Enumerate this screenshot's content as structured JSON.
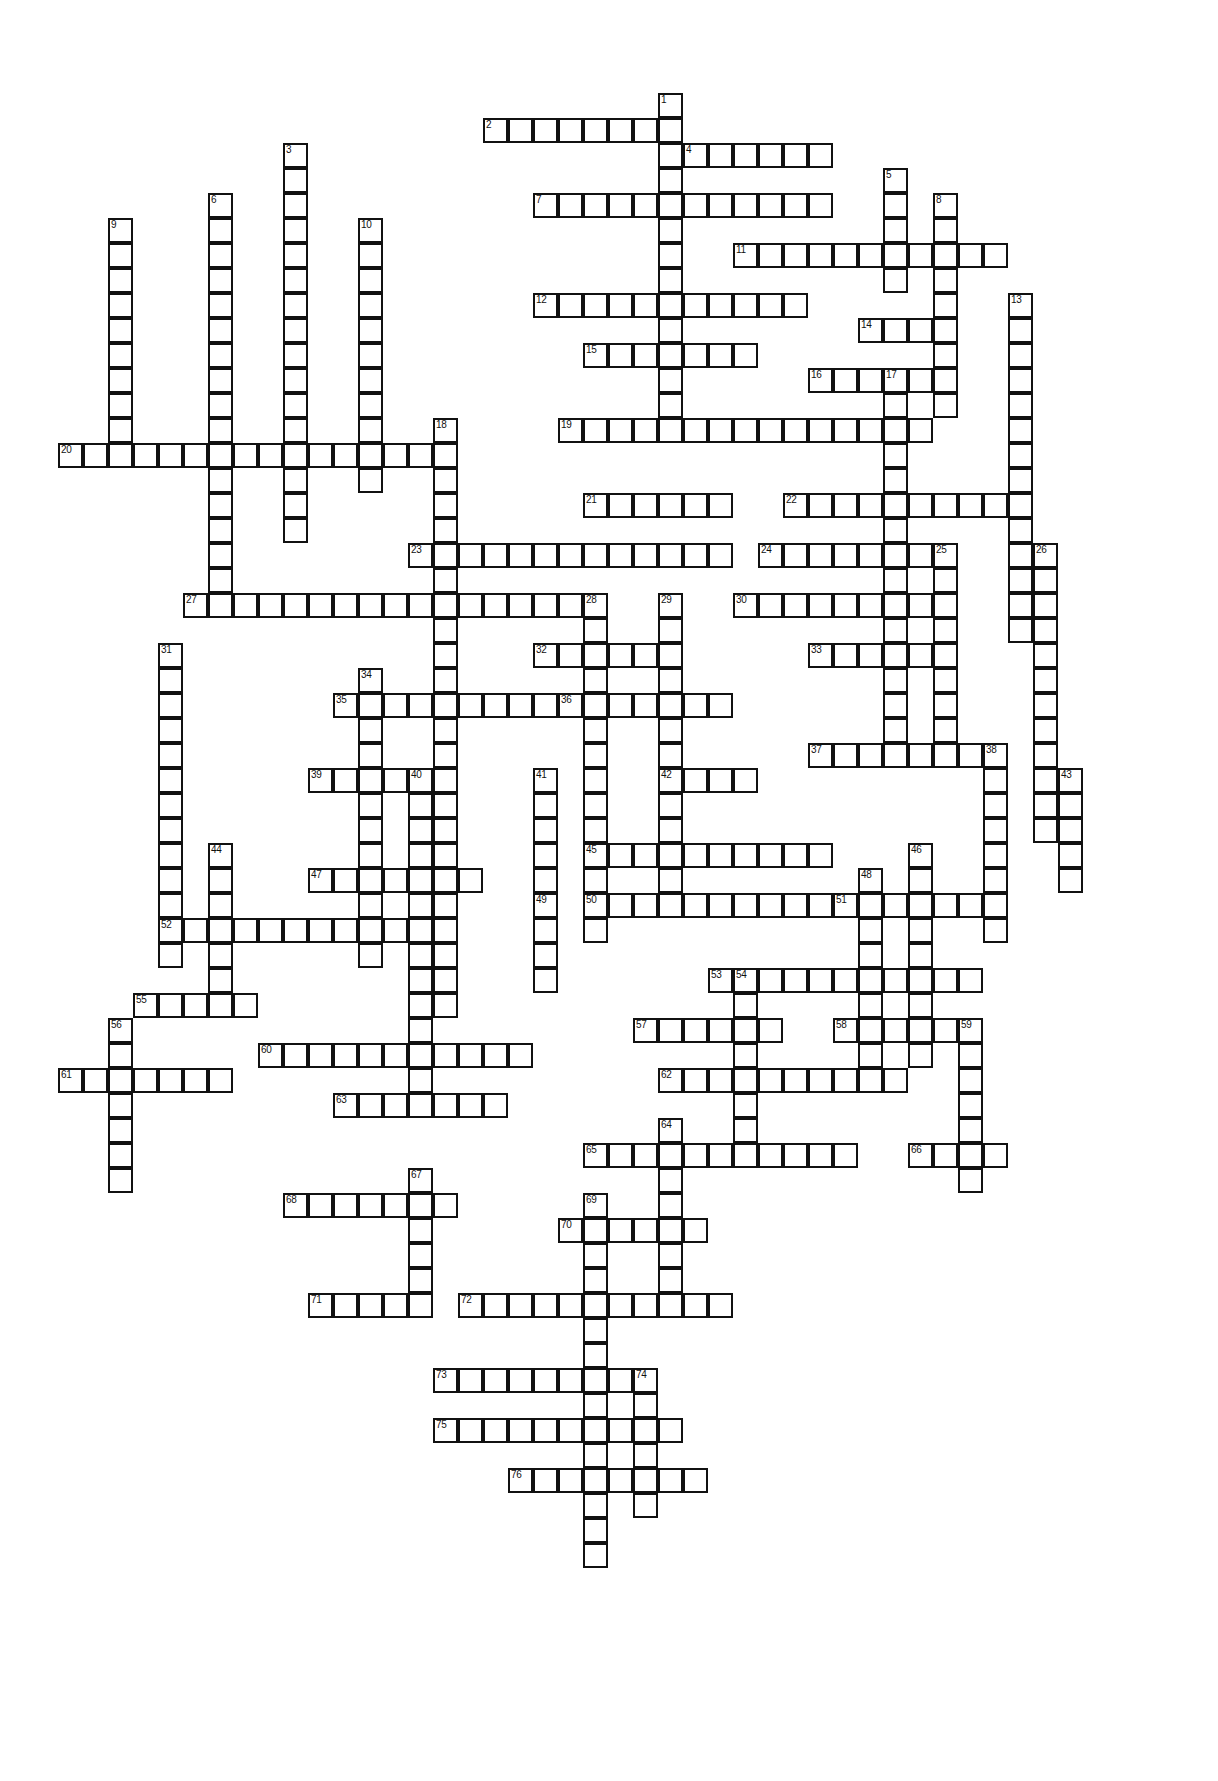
{
  "puzzle": {
    "type": "crossword-grid",
    "title": "",
    "cell_size": 25,
    "origin_x": 58,
    "origin_y": 93,
    "colors": {
      "cell_fill": "#ffffff",
      "cell_border": "#111111",
      "number_text": "#111111",
      "background": "#ffffff"
    },
    "clue_count": 76,
    "entries": [
      {
        "number": "1",
        "direction": "down",
        "col": 24,
        "row": 0,
        "length": 14
      },
      {
        "number": "2",
        "direction": "across",
        "col": 17,
        "row": 1,
        "length": 8
      },
      {
        "number": "3",
        "direction": "down",
        "col": 9,
        "row": 2,
        "length": 16
      },
      {
        "number": "4",
        "direction": "across",
        "col": 25,
        "row": 2,
        "length": 6
      },
      {
        "number": "5",
        "direction": "down",
        "col": 33,
        "row": 3,
        "length": 5
      },
      {
        "number": "6",
        "direction": "down",
        "col": 6,
        "row": 4,
        "length": 16
      },
      {
        "number": "7",
        "direction": "across",
        "col": 19,
        "row": 4,
        "length": 12
      },
      {
        "number": "8",
        "direction": "down",
        "col": 35,
        "row": 4,
        "length": 9
      },
      {
        "number": "9",
        "direction": "down",
        "col": 2,
        "row": 5,
        "length": 10
      },
      {
        "number": "10",
        "direction": "down",
        "col": 12,
        "row": 5,
        "length": 11
      },
      {
        "number": "11",
        "direction": "across",
        "col": 27,
        "row": 6,
        "length": 11
      },
      {
        "number": "12",
        "direction": "across",
        "col": 19,
        "row": 8,
        "length": 11
      },
      {
        "number": "13",
        "direction": "down",
        "col": 38,
        "row": 8,
        "length": 14
      },
      {
        "number": "14",
        "direction": "across",
        "col": 32,
        "row": 9,
        "length": 4
      },
      {
        "number": "15",
        "direction": "across",
        "col": 21,
        "row": 10,
        "length": 7
      },
      {
        "number": "16",
        "direction": "across",
        "col": 30,
        "row": 11,
        "length": 5
      },
      {
        "number": "17",
        "direction": "down",
        "col": 33,
        "row": 11,
        "length": 15
      },
      {
        "number": "18",
        "direction": "down",
        "col": 15,
        "row": 13,
        "length": 24
      },
      {
        "number": "19",
        "direction": "across",
        "col": 20,
        "row": 13,
        "length": 15
      },
      {
        "number": "20",
        "direction": "across",
        "col": 0,
        "row": 14,
        "length": 16
      },
      {
        "number": "21",
        "direction": "across",
        "col": 21,
        "row": 16,
        "length": 6
      },
      {
        "number": "22",
        "direction": "across",
        "col": 29,
        "row": 16,
        "length": 9
      },
      {
        "number": "23",
        "direction": "across",
        "col": 14,
        "row": 18,
        "length": 13
      },
      {
        "number": "24",
        "direction": "across",
        "col": 28,
        "row": 18,
        "length": 7
      },
      {
        "number": "25",
        "direction": "down",
        "col": 35,
        "row": 18,
        "length": 9
      },
      {
        "number": "26",
        "direction": "down",
        "col": 39,
        "row": 18,
        "length": 12
      },
      {
        "number": "27",
        "direction": "across",
        "col": 5,
        "row": 20,
        "length": 16
      },
      {
        "number": "28",
        "direction": "down",
        "col": 21,
        "row": 20,
        "length": 14
      },
      {
        "number": "29",
        "direction": "down",
        "col": 24,
        "row": 20,
        "length": 12
      },
      {
        "number": "30",
        "direction": "across",
        "col": 27,
        "row": 20,
        "length": 8
      },
      {
        "number": "31",
        "direction": "down",
        "col": 4,
        "row": 22,
        "length": 13
      },
      {
        "number": "32",
        "direction": "across",
        "col": 19,
        "row": 22,
        "length": 6
      },
      {
        "number": "33",
        "direction": "across",
        "col": 30,
        "row": 22,
        "length": 5
      },
      {
        "number": "34",
        "direction": "down",
        "col": 12,
        "row": 23,
        "length": 12
      },
      {
        "number": "35",
        "direction": "across",
        "col": 11,
        "row": 24,
        "length": 9
      },
      {
        "number": "36",
        "direction": "across",
        "col": 20,
        "row": 24,
        "length": 7
      },
      {
        "number": "37",
        "direction": "across",
        "col": 30,
        "row": 26,
        "length": 8
      },
      {
        "number": "38",
        "direction": "down",
        "col": 37,
        "row": 26,
        "length": 8
      },
      {
        "number": "39",
        "direction": "across",
        "col": 10,
        "row": 27,
        "length": 5
      },
      {
        "number": "40",
        "direction": "down",
        "col": 14,
        "row": 27,
        "length": 14
      },
      {
        "number": "41",
        "direction": "down",
        "col": 19,
        "row": 27,
        "length": 9
      },
      {
        "number": "42",
        "direction": "across",
        "col": 24,
        "row": 27,
        "length": 4
      },
      {
        "number": "43",
        "direction": "down",
        "col": 40,
        "row": 27,
        "length": 5
      },
      {
        "number": "44",
        "direction": "down",
        "col": 6,
        "row": 30,
        "length": 7
      },
      {
        "number": "45",
        "direction": "across",
        "col": 21,
        "row": 30,
        "length": 10
      },
      {
        "number": "46",
        "direction": "down",
        "col": 34,
        "row": 30,
        "length": 9
      },
      {
        "number": "47",
        "direction": "across",
        "col": 10,
        "row": 31,
        "length": 7
      },
      {
        "number": "48",
        "direction": "down",
        "col": 32,
        "row": 31,
        "length": 9
      },
      {
        "number": "49",
        "direction": "down",
        "col": 19,
        "row": 32,
        "length": 4
      },
      {
        "number": "50",
        "direction": "across",
        "col": 21,
        "row": 32,
        "length": 10
      },
      {
        "number": "51",
        "direction": "across",
        "col": 31,
        "row": 32,
        "length": 7
      },
      {
        "number": "52",
        "direction": "across",
        "col": 4,
        "row": 33,
        "length": 10
      },
      {
        "number": "53",
        "direction": "across",
        "col": 26,
        "row": 35,
        "length": 11
      },
      {
        "number": "54",
        "direction": "down",
        "col": 27,
        "row": 35,
        "length": 8
      },
      {
        "number": "55",
        "direction": "across",
        "col": 3,
        "row": 36,
        "length": 5
      },
      {
        "number": "56",
        "direction": "down",
        "col": 2,
        "row": 37,
        "length": 7
      },
      {
        "number": "57",
        "direction": "across",
        "col": 23,
        "row": 37,
        "length": 6
      },
      {
        "number": "58",
        "direction": "across",
        "col": 31,
        "row": 37,
        "length": 6
      },
      {
        "number": "59",
        "direction": "down",
        "col": 36,
        "row": 37,
        "length": 7
      },
      {
        "number": "60",
        "direction": "across",
        "col": 8,
        "row": 38,
        "length": 11
      },
      {
        "number": "61",
        "direction": "across",
        "col": 0,
        "row": 39,
        "length": 7
      },
      {
        "number": "62",
        "direction": "across",
        "col": 24,
        "row": 39,
        "length": 10
      },
      {
        "number": "63",
        "direction": "across",
        "col": 11,
        "row": 40,
        "length": 7
      },
      {
        "number": "64",
        "direction": "down",
        "col": 24,
        "row": 41,
        "length": 7
      },
      {
        "number": "65",
        "direction": "across",
        "col": 21,
        "row": 42,
        "length": 11
      },
      {
        "number": "66",
        "direction": "across",
        "col": 34,
        "row": 42,
        "length": 4
      },
      {
        "number": "67",
        "direction": "down",
        "col": 14,
        "row": 43,
        "length": 6
      },
      {
        "number": "68",
        "direction": "across",
        "col": 9,
        "row": 44,
        "length": 7
      },
      {
        "number": "69",
        "direction": "down",
        "col": 21,
        "row": 44,
        "length": 15
      },
      {
        "number": "70",
        "direction": "across",
        "col": 20,
        "row": 45,
        "length": 6
      },
      {
        "number": "71",
        "direction": "across",
        "col": 10,
        "row": 48,
        "length": 5
      },
      {
        "number": "72",
        "direction": "across",
        "col": 16,
        "row": 48,
        "length": 11
      },
      {
        "number": "73",
        "direction": "across",
        "col": 15,
        "row": 51,
        "length": 8
      },
      {
        "number": "74",
        "direction": "down",
        "col": 23,
        "row": 51,
        "length": 6
      },
      {
        "number": "75",
        "direction": "across",
        "col": 15,
        "row": 53,
        "length": 10
      },
      {
        "number": "76",
        "direction": "across",
        "col": 18,
        "row": 55,
        "length": 8
      }
    ]
  }
}
